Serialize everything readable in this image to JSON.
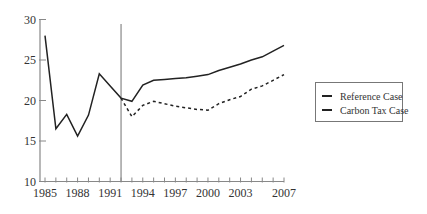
{
  "chart_data": {
    "type": "line",
    "title": "",
    "xlabel": "",
    "ylabel": "",
    "ylim": [
      10,
      30
    ],
    "xlim": [
      1985,
      2007
    ],
    "y_ticks": [
      10,
      15,
      20,
      25,
      30
    ],
    "x_tick_labels": [
      "1985",
      "1988",
      "1991",
      "1994",
      "1997",
      "2000",
      "2003",
      "2007"
    ],
    "x_tick_label_years": [
      1985,
      1988,
      1991,
      1994,
      1997,
      2000,
      2003,
      2007
    ],
    "x_minor_ticks_every": 1,
    "grid": false,
    "legend_position": "right",
    "annotations": [
      {
        "type": "vertical-line",
        "x": 1992,
        "description": "divider between historical and projected period"
      }
    ],
    "series": [
      {
        "name": "Reference Case",
        "style": "solid",
        "x": [
          1985,
          1986,
          1987,
          1988,
          1989,
          1990,
          1991,
          1992,
          1993,
          1994,
          1995,
          1996,
          1997,
          1998,
          1999,
          2000,
          2001,
          2002,
          2003,
          2004,
          2005,
          2006,
          2007
        ],
        "values": [
          28.0,
          16.5,
          18.3,
          15.6,
          18.2,
          23.3,
          21.8,
          20.3,
          19.9,
          21.9,
          22.5,
          22.6,
          22.7,
          22.8,
          23.0,
          23.2,
          23.7,
          24.1,
          24.5,
          25.0,
          25.4,
          26.1,
          26.8
        ]
      },
      {
        "name": "Carbon Tax Case",
        "style": "dashed",
        "x": [
          1992,
          1993,
          1994,
          1995,
          1996,
          1997,
          1998,
          1999,
          2000,
          2001,
          2002,
          2003,
          2004,
          2005,
          2006,
          2007
        ],
        "values": [
          20.3,
          18.0,
          19.4,
          19.9,
          19.6,
          19.3,
          19.1,
          18.9,
          18.8,
          19.6,
          20.1,
          20.5,
          21.4,
          21.8,
          22.5,
          23.2
        ]
      }
    ]
  },
  "legend": {
    "items": [
      {
        "label": "Reference Case",
        "style": "solid"
      },
      {
        "label": "Carbon Tax Case",
        "style": "dashed"
      }
    ]
  },
  "colors": {
    "axis": "#888888",
    "line": "#222222",
    "text": "#333333"
  }
}
